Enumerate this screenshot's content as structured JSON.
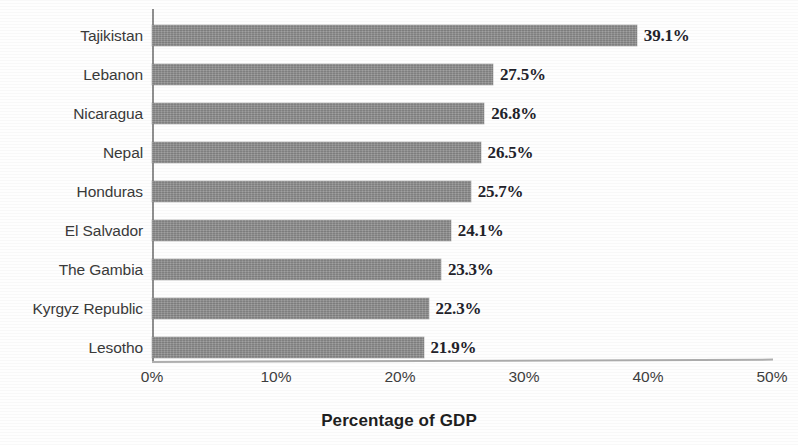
{
  "chart_data": {
    "type": "bar",
    "orientation": "horizontal",
    "title": "",
    "xlabel": "Percentage of GDP",
    "ylabel": "",
    "xlim": [
      0,
      50
    ],
    "xticks": [
      "0%",
      "10%",
      "20%",
      "30%",
      "40%",
      "50%"
    ],
    "xtick_values": [
      0,
      10,
      20,
      30,
      40,
      50
    ],
    "grid": false,
    "legend": null,
    "bar_color": "#8c8c8c",
    "categories": [
      "Tajikistan",
      "Lebanon",
      "Nicaragua",
      "Nepal",
      "Honduras",
      "El Salvador",
      "The Gambia",
      "Kyrgyz Republic",
      "Lesotho"
    ],
    "values": [
      39.1,
      27.5,
      26.8,
      26.5,
      25.7,
      24.1,
      23.3,
      22.3,
      21.9
    ],
    "data_labels": [
      "39.1%",
      "27.5%",
      "26.8%",
      "26.5%",
      "25.7%",
      "24.1%",
      "23.3%",
      "22.3%",
      "21.9%"
    ],
    "bars": [
      {
        "category": "Tajikistan",
        "value": 39.1,
        "label": "39.1%"
      },
      {
        "category": "Lebanon",
        "value": 27.5,
        "label": "27.5%"
      },
      {
        "category": "Nicaragua",
        "value": 26.8,
        "label": "26.8%"
      },
      {
        "category": "Nepal",
        "value": 26.5,
        "label": "26.5%"
      },
      {
        "category": "Honduras",
        "value": 25.7,
        "label": "25.7%"
      },
      {
        "category": "El Salvador",
        "value": 24.1,
        "label": "24.1%"
      },
      {
        "category": "The Gambia",
        "value": 23.3,
        "label": "23.3%"
      },
      {
        "category": "Kyrgyz Republic",
        "value": 22.3,
        "label": "22.3%"
      },
      {
        "category": "Lesotho",
        "value": 21.9,
        "label": "21.9%"
      }
    ]
  }
}
